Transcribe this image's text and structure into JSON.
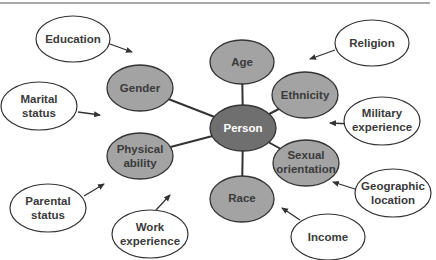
{
  "diagram": {
    "center": {
      "label": "Person",
      "fill": "#6f6f6f",
      "text_color": "#ffffff"
    },
    "inner_nodes": [
      {
        "label": [
          "Age"
        ]
      },
      {
        "label": [
          "Gender"
        ]
      },
      {
        "label": [
          "Ethnicity"
        ]
      },
      {
        "label": [
          "Physical",
          "ability"
        ]
      },
      {
        "label": [
          "Sexual",
          "orientation"
        ]
      },
      {
        "label": [
          "Race"
        ]
      }
    ],
    "outer_nodes": [
      {
        "label": [
          "Education"
        ]
      },
      {
        "label": [
          "Religion"
        ]
      },
      {
        "label": [
          "Marital",
          "status"
        ]
      },
      {
        "label": [
          "Military",
          "experience"
        ]
      },
      {
        "label": [
          "Parental",
          "status"
        ]
      },
      {
        "label": [
          "Work",
          "experience"
        ]
      },
      {
        "label": [
          "Geographic",
          "location"
        ]
      },
      {
        "label": [
          "Income"
        ]
      }
    ],
    "colors": {
      "inner_fill": "#a3a3a3",
      "outer_fill": "#ffffff",
      "stroke": "#333333",
      "text": "#3a3a3a"
    }
  }
}
